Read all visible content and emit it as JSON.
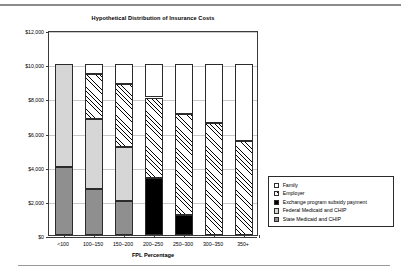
{
  "chart_data": {
    "type": "bar",
    "title": "Hypothetical Distribution of Insurance Costs",
    "xlabel": "FPL Percentage",
    "ylabel": "",
    "stacked": true,
    "grid": true,
    "legend_position": "right-outside",
    "ylim": [
      0,
      12000
    ],
    "yticks": [
      0,
      2000,
      4000,
      6000,
      8000,
      10000,
      12000
    ],
    "ytick_labels": [
      "$0",
      "$2,000",
      "$4,000",
      "$6,000",
      "$8,000",
      "$10,000",
      "$12,000"
    ],
    "categories": [
      "<100",
      "100–150",
      "150–200",
      "200–250",
      "250–300",
      "300–350",
      "350+"
    ],
    "series": [
      {
        "name": "State Medicaid and CHIP",
        "fill": "solid-dark-gray",
        "color": "#8f8f8f",
        "values": [
          4000,
          2700,
          2000,
          0,
          0,
          0,
          0
        ]
      },
      {
        "name": "Federal Medicaid and CHIP",
        "fill": "solid-light-gray",
        "color": "#d6d6d6",
        "values": [
          6000,
          4100,
          3150,
          0,
          0,
          0,
          0
        ]
      },
      {
        "name": "Exchange program subsidy payment",
        "fill": "solid-black",
        "color": "#000000",
        "values": [
          0,
          0,
          0,
          3350,
          1200,
          0,
          0
        ]
      },
      {
        "name": "Employer",
        "fill": "diagonal-hatch",
        "color": "#ffffff",
        "values": [
          0,
          2600,
          3700,
          4700,
          5900,
          6550,
          5500
        ]
      },
      {
        "name": "Family",
        "fill": "solid-white",
        "color": "#ffffff",
        "values": [
          0,
          600,
          1150,
          1950,
          2900,
          3450,
          4500
        ]
      }
    ],
    "totals": [
      10000,
      10000,
      10000,
      10000,
      10000,
      10000,
      10000
    ]
  },
  "legend": {
    "items": [
      {
        "label": "Family",
        "swatch": "solid-white"
      },
      {
        "label": "Employer",
        "swatch": "diagonal-hatch"
      },
      {
        "label": "Exchange program subsidy payment",
        "swatch": "solid-black"
      },
      {
        "label": "Federal Medicaid and CHIP",
        "swatch": "solid-light-gray"
      },
      {
        "label": "State Medicaid and CHIP",
        "swatch": "solid-dark-gray"
      }
    ]
  }
}
